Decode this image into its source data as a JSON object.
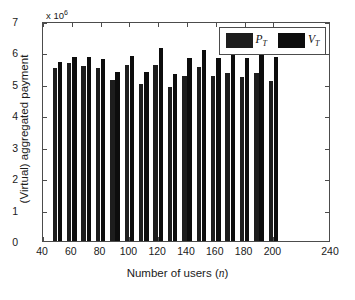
{
  "chart_data": {
    "type": "bar",
    "title": "",
    "subtitle": "",
    "xlabel": "Number of users (n)",
    "xlabel_plain": "Number of users",
    "xlabel_variable": "n",
    "ylabel": "(Virtual) aggregated payment",
    "y_exponent_label": "x 10",
    "y_exponent_power": "6",
    "y_scale_factor": 1000000,
    "grid": false,
    "legend_position": "top-right",
    "xlim": [
      40,
      240
    ],
    "ylim": [
      0,
      7
    ],
    "xticks": [
      40,
      60,
      80,
      100,
      120,
      140,
      160,
      180,
      200,
      240
    ],
    "xtick_labels": [
      "40",
      "60",
      "80",
      "100",
      "120",
      "140",
      "160",
      "180",
      "200",
      "240"
    ],
    "yticks": [
      0,
      1,
      2,
      3,
      4,
      5,
      6,
      7
    ],
    "ytick_labels": [
      "0",
      "1",
      "2",
      "3",
      "4",
      "5",
      "6",
      "7"
    ],
    "categories": [
      50,
      60,
      70,
      80,
      90,
      100,
      110,
      120,
      130,
      140,
      150,
      160,
      170,
      180,
      190,
      200
    ],
    "series": [
      {
        "name": "P_T",
        "label_base": "P",
        "label_sub": "T",
        "color": "#1d1d1d",
        "values": [
          5.51,
          5.67,
          5.58,
          5.5,
          5.12,
          5.6,
          5.0,
          5.6,
          4.9,
          5.25,
          5.54,
          5.25,
          5.36,
          5.21,
          5.35,
          5.1
        ]
      },
      {
        "name": "V_T",
        "label_base": "V",
        "label_sub": "T",
        "color": "#0d0d0d",
        "values": [
          5.7,
          5.84,
          5.85,
          5.78,
          5.37,
          5.89,
          5.39,
          6.13,
          5.33,
          5.82,
          6.09,
          5.83,
          5.92,
          5.83,
          6.02,
          5.85
        ]
      }
    ]
  }
}
